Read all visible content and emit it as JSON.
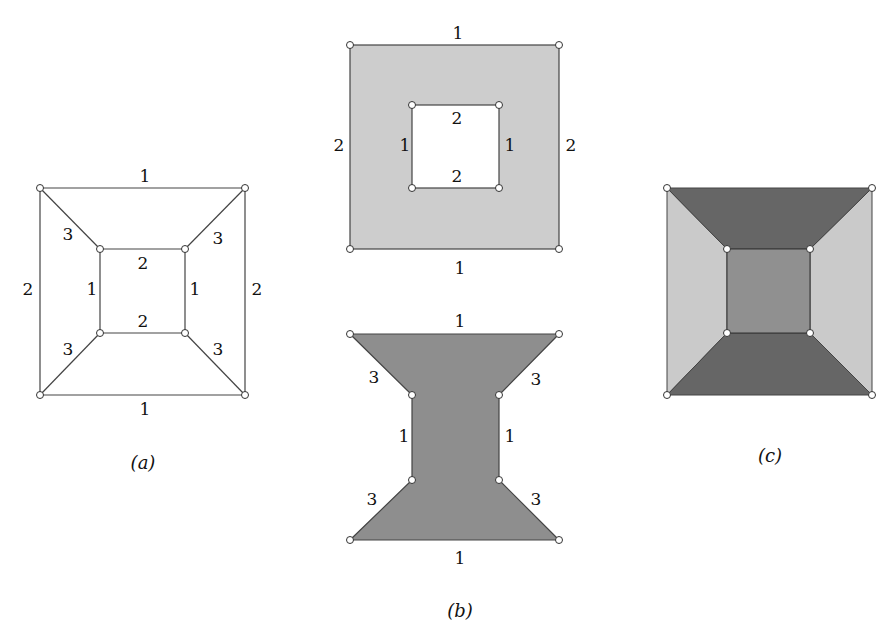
{
  "figure": {
    "captions": {
      "a": "(a)",
      "b": "(b)",
      "c": "(c)"
    },
    "panel_a": {
      "description": "Graph drawing: outer square and inner square connected by four diagonal edges",
      "edge_labels": {
        "outer_top": "1",
        "outer_bottom": "1",
        "outer_left": "2",
        "outer_right": "2",
        "inner_top": "2",
        "inner_bottom": "2",
        "inner_left": "1",
        "inner_right": "1",
        "diag_top_left": "3",
        "diag_top_right": "3",
        "diag_bottom_left": "3",
        "diag_bottom_right": "3"
      }
    },
    "panel_b_top": {
      "description": "Annulus region: outer square minus inner square, shaded light gray",
      "fill_color": "#cdcdcd",
      "edge_labels": {
        "outer_top": "1",
        "outer_bottom": "1",
        "outer_left": "2",
        "outer_right": "2",
        "inner_top": "2",
        "inner_bottom": "2",
        "inner_left": "1",
        "inner_right": "1"
      }
    },
    "panel_b_bottom": {
      "description": "Hourglass region shaded medium gray",
      "fill_color": "#8e8e8e",
      "edge_labels": {
        "top": "1",
        "bottom": "1",
        "inner_left": "1",
        "inner_right": "1",
        "diag_top_left": "3",
        "diag_top_right": "3",
        "diag_bottom_left": "3",
        "diag_bottom_right": "3"
      }
    },
    "panel_c": {
      "description": "Square subdivided into five faces shaded in three gray levels",
      "colors": {
        "top_bottom": "#666666",
        "left_right": "#cacaca",
        "center": "#909090"
      }
    }
  }
}
